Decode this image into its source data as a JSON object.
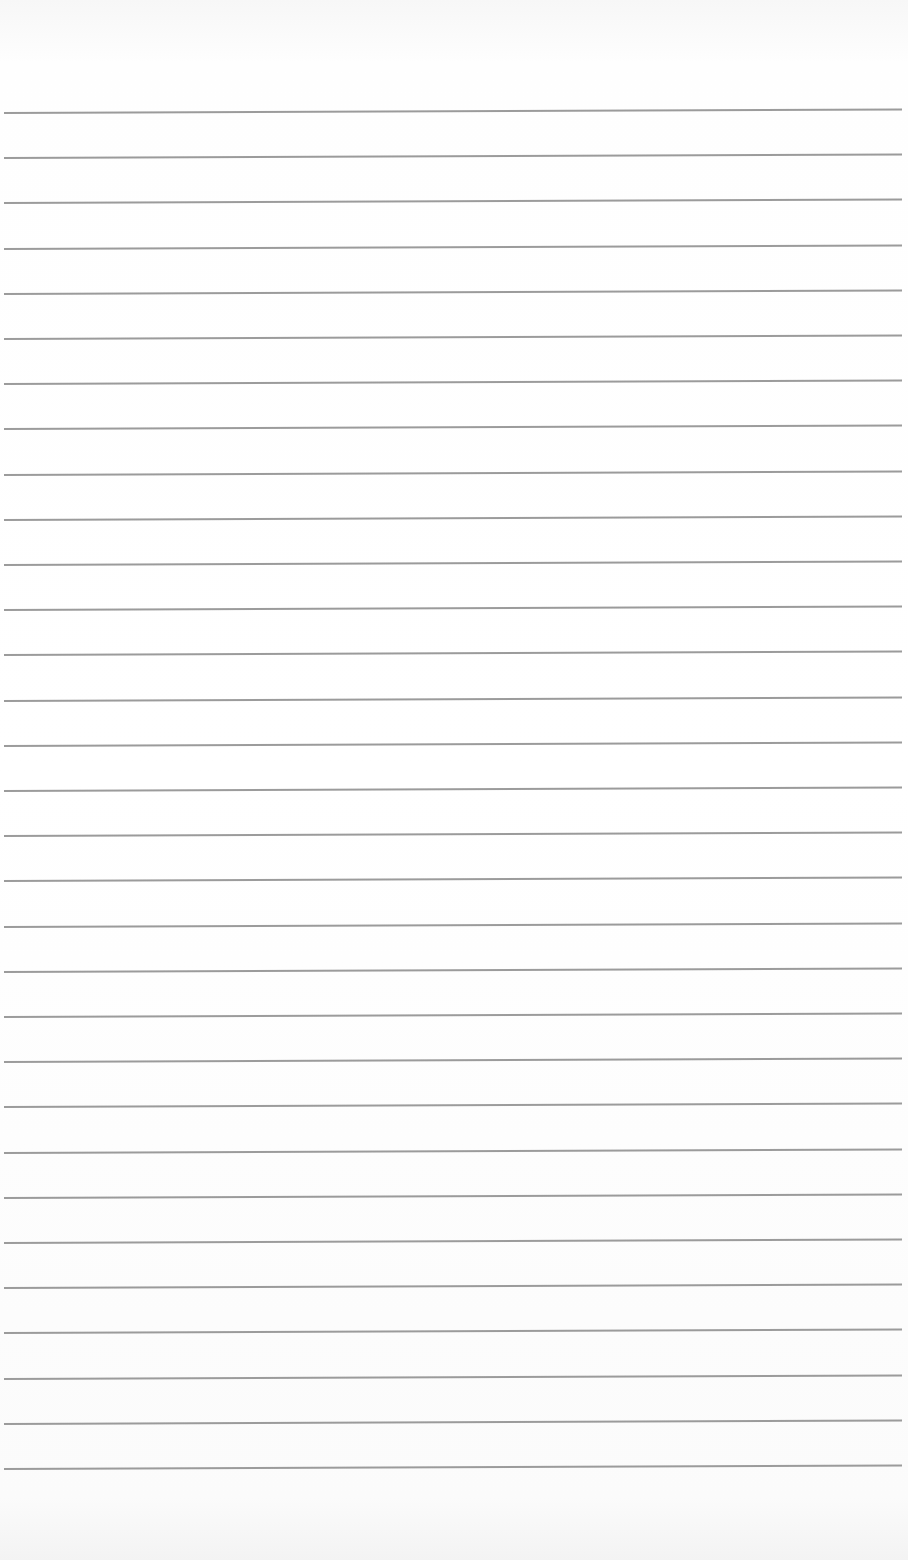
{
  "paper": {
    "type": "lined-paper",
    "line_count": 31,
    "first_line_y": 112,
    "line_spacing": 45.2,
    "line_color": "#8a8a8a",
    "background_color": "#ffffff"
  }
}
